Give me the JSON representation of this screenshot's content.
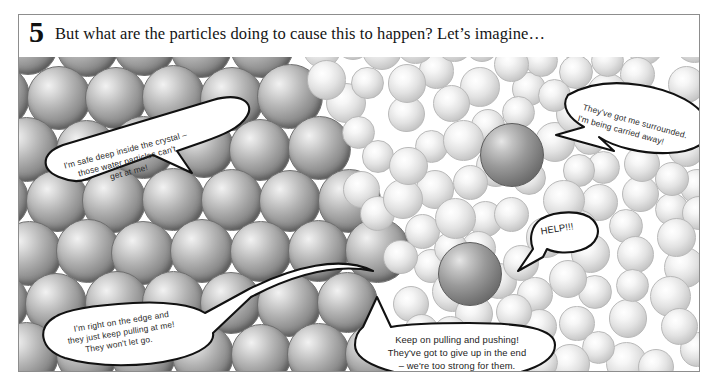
{
  "panel": {
    "step_number": "5",
    "caption": "But what are the particles doing to cause this to happen? Let’s imagine…",
    "border_color": "#8d8d8d",
    "background": "#ffffff"
  },
  "regions": [
    {
      "name": "crystal-solid-region",
      "description": "densely packed large dark spheres forming a crystal lattice on the left"
    },
    {
      "name": "water-liquid-region",
      "description": "loosely scattered smaller pale spheres representing water particles on the right"
    }
  ],
  "speech_bubbles": [
    {
      "id": "bubble-inside-crystal",
      "name": "bubble-safe-inside-crystal",
      "lines": [
        "I'm safe deep inside the crystal –",
        "those water particles can't",
        "get at me!"
      ],
      "points_to": "large sphere deep within the crystal lattice"
    },
    {
      "id": "bubble-surrounded",
      "name": "bubble-carried-away",
      "lines": [
        "They've got me surrounded.",
        "I'm being carried away!"
      ],
      "points_to": "dark sphere suspended in the water region"
    },
    {
      "id": "bubble-help",
      "name": "bubble-help",
      "lines": [
        "HELP!!!"
      ],
      "points_to": "dark sphere breaking away into the water"
    },
    {
      "id": "bubble-edge",
      "name": "bubble-on-the-edge",
      "lines": [
        "I'm right on the edge and",
        "they just keep pulling at me!",
        "They won't let go."
      ],
      "points_to": "sphere at the crystal surface"
    },
    {
      "id": "bubble-keep-pulling",
      "name": "bubble-keep-pulling-and-pushing",
      "lines": [
        "Keep on pulling and pushing!",
        "They've got to give up in the end",
        "– we're too strong for them."
      ],
      "points_to": "water particles attacking the crystal"
    }
  ],
  "colors": {
    "crystal_sphere_light": "#f2f2f2",
    "crystal_sphere_dark": "#5a5a5a",
    "water_sphere_light": "#ffffff",
    "water_sphere_dark": "#a2a2a2",
    "bubble_stroke": "#111111",
    "bubble_fill": "#ffffff",
    "text": "#141414"
  }
}
